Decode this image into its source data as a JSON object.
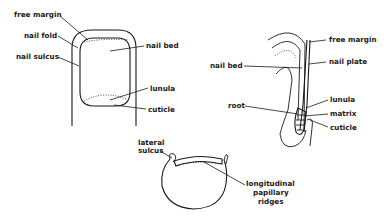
{
  "figure": {
    "panels": [
      {
        "id": "dorsal-view",
        "labels": [
          "free margin",
          "nail fold",
          "nail sulcus",
          "nail bed",
          "lunula",
          "cuticle"
        ]
      },
      {
        "id": "sagittal-section",
        "labels": [
          "free margin",
          "nail plate",
          "nail bed",
          "root",
          "lunula",
          "matrix",
          "cuticle"
        ]
      },
      {
        "id": "cross-section",
        "labels": [
          "lateral sulcus",
          "longitudinal",
          "papillary",
          "ridges"
        ]
      }
    ]
  },
  "dorsal": {
    "free_margin": "free margin",
    "nail_fold": "nail fold",
    "nail_sulcus": "nail sulcus",
    "nail_bed": "nail bed",
    "lunula": "lunula",
    "cuticle": "cuticle"
  },
  "sagittal": {
    "free_margin": "free margin",
    "nail_plate": "nail plate",
    "nail_bed": "nail bed",
    "root": "root",
    "lunula": "lunula",
    "matrix": "matrix",
    "cuticle": "cuticle"
  },
  "cross": {
    "lateral_line1": "lateral",
    "lateral_line2": "sulcus",
    "ridges_line1": "longitudinal",
    "ridges_line2": "papillary",
    "ridges_line3": "ridges"
  }
}
